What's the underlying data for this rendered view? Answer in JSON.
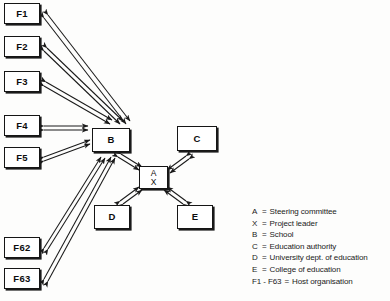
{
  "figure": {
    "kind": "network-diagram",
    "background_color": "#fdfdfc",
    "line_color": "#1a1a1a",
    "box_fill": "#ffffff"
  },
  "nodes": [
    {
      "id": "F1",
      "label": "F1",
      "x": 4,
      "y": 3,
      "w": 36,
      "h": 21
    },
    {
      "id": "F2",
      "label": "F2",
      "x": 4,
      "y": 36,
      "w": 36,
      "h": 21
    },
    {
      "id": "F3",
      "label": "F3",
      "x": 4,
      "y": 71,
      "w": 36,
      "h": 21
    },
    {
      "id": "F4",
      "label": "F4",
      "x": 4,
      "y": 115,
      "w": 36,
      "h": 21
    },
    {
      "id": "F5",
      "label": "F5",
      "x": 4,
      "y": 147,
      "w": 36,
      "h": 21
    },
    {
      "id": "F62",
      "label": "F62",
      "x": 4,
      "y": 237,
      "w": 36,
      "h": 21
    },
    {
      "id": "F63",
      "label": "F63",
      "x": 4,
      "y": 268,
      "w": 36,
      "h": 21
    },
    {
      "id": "B",
      "label": "B",
      "x": 92,
      "y": 128,
      "w": 38,
      "h": 24
    },
    {
      "id": "C",
      "label": "C",
      "x": 177,
      "y": 126,
      "w": 40,
      "h": 25
    },
    {
      "id": "AX",
      "label": "A",
      "label2": "X",
      "x": 139,
      "y": 166,
      "w": 29,
      "h": 23
    },
    {
      "id": "D",
      "label": "D",
      "x": 94,
      "y": 205,
      "w": 36,
      "h": 24
    },
    {
      "id": "E",
      "label": "E",
      "x": 177,
      "y": 205,
      "w": 36,
      "h": 24
    }
  ],
  "edges": [
    {
      "from": "F1",
      "to": "B",
      "style": "double-line-bidirectional"
    },
    {
      "from": "F2",
      "to": "B",
      "style": "double-line-bidirectional"
    },
    {
      "from": "F3",
      "to": "B",
      "style": "double-line-bidirectional"
    },
    {
      "from": "F4",
      "to": "B",
      "style": "double-line-bidirectional"
    },
    {
      "from": "F5",
      "to": "B",
      "style": "double-line-bidirectional"
    },
    {
      "from": "F62",
      "to": "B",
      "style": "double-line-bidirectional"
    },
    {
      "from": "F63",
      "to": "B",
      "style": "double-line-bidirectional"
    },
    {
      "from": "B",
      "to": "AX",
      "style": "double-line-bidirectional"
    },
    {
      "from": "C",
      "to": "AX",
      "style": "double-line-bidirectional"
    },
    {
      "from": "D",
      "to": "AX",
      "style": "double-line-bidirectional"
    },
    {
      "from": "E",
      "to": "AX",
      "style": "double-line-bidirectional"
    }
  ],
  "legend": {
    "rows": [
      {
        "key": "A",
        "eq": "=",
        "text": "Steering committee"
      },
      {
        "key": "X",
        "eq": "=",
        "text": "Project leader"
      },
      {
        "key": "B",
        "eq": "=",
        "text": "School"
      },
      {
        "key": "C",
        "eq": "=",
        "text": "Education authority"
      },
      {
        "key": "D",
        "eq": "=",
        "text": "University dept. of education"
      },
      {
        "key": "E",
        "eq": "=",
        "text": "College of education"
      },
      {
        "key": "F1 - F63",
        "eq": "=",
        "text": "Host organisation"
      }
    ]
  }
}
